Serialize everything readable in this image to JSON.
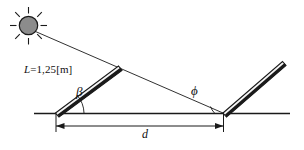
{
  "figure": {
    "type": "physics-diagram",
    "background_color": "#ffffff",
    "line_color": "#1a1a1a",
    "sun_fill_color": "#8c8c8c",
    "panel_fill_color": "#f2f2f2",
    "labels": {
      "length": {
        "symbol": "L",
        "equals": "=1,25[m]",
        "full_text": "L=1,25[m]",
        "value": 1.25,
        "unit": "m"
      },
      "angle_left": {
        "symbol": "β",
        "name": "beta",
        "description": "tilt angle of left panel from ground"
      },
      "angle_right": {
        "symbol": "ϕ",
        "name": "phi",
        "description": "sun ray incidence angle at base of right panel"
      },
      "distance": {
        "symbol": "d",
        "name": "d",
        "description": "horizontal distance between panel bases"
      }
    },
    "elements": {
      "sun": "sun-icon",
      "sun_ray": "sun-ray-line",
      "ground": "ground-line",
      "left_panel": "left-solar-panel",
      "right_panel": "right-solar-panel",
      "dimension": "distance-dimension-line"
    }
  }
}
